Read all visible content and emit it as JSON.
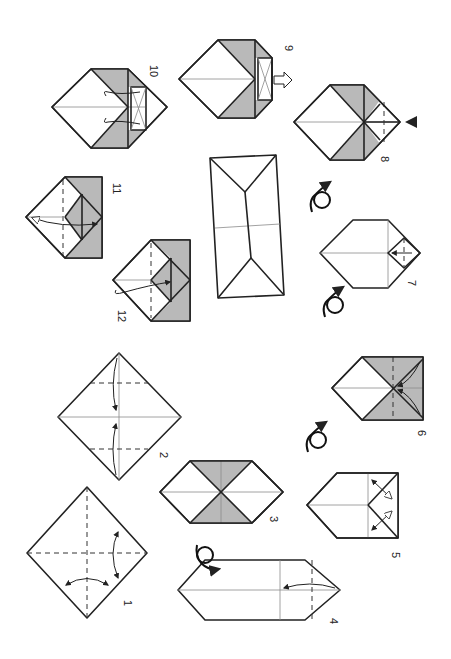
{
  "diagram": {
    "type": "origami-folding-instructions",
    "orientation": "rotated-90-clockwise",
    "colors": {
      "paper_front": "#ffffff",
      "paper_back": "#b9b9b9",
      "line": "#222222",
      "crease": "#8a8a8a"
    },
    "steps": [
      {
        "number": "1",
        "description": "square with dashed valley creases both ways, fold-and-unfold arrows"
      },
      {
        "number": "2",
        "description": "square, two corners folded to center"
      },
      {
        "number": "3",
        "description": "hexagon with grey triangles"
      },
      {
        "number": "4",
        "description": "grey hexagon, fold edge to center line"
      },
      {
        "number": "5",
        "description": "grey pentagon with white pocket, fold-unfold arrows"
      },
      {
        "number": "6",
        "description": "hexagon with squash folds"
      },
      {
        "number": "7",
        "description": "grey hexagon with small folded square"
      },
      {
        "number": "8",
        "description": "hexagon, push-in arrow"
      },
      {
        "number": "9",
        "description": "hexagon, pull out flap"
      },
      {
        "number": "10",
        "description": "hexagon, curl flaps"
      },
      {
        "number": "11",
        "description": "house shape, fold tip down"
      },
      {
        "number": "12",
        "description": "house shape, fold tip inside"
      }
    ],
    "result": {
      "description": "finished grey rectangle (box/envelope)"
    },
    "flip_symbols": 4
  }
}
